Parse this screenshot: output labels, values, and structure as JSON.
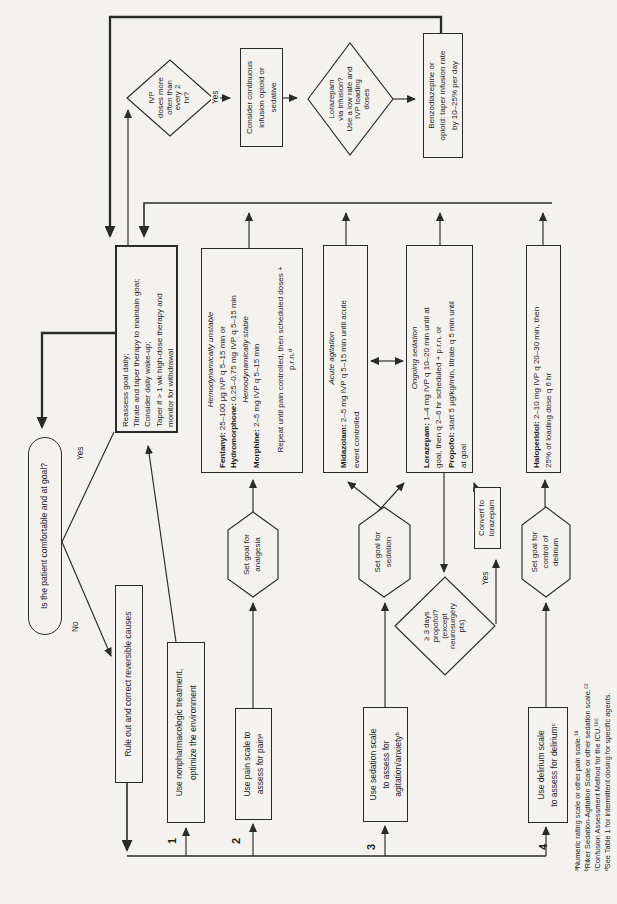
{
  "oval": {
    "text": "Is the patient comfortable and at goal?"
  },
  "labels": {
    "yes_oval": "Yes",
    "no_oval": "No",
    "yes_ivp": "Yes",
    "yes_propofol": "Yes"
  },
  "steps": {
    "n1": "1",
    "n2": "2",
    "n3": "3",
    "n4": "4"
  },
  "boxes": {
    "rule_out": {
      "text": "Rule out and correct reversible causes"
    },
    "nonpharm": {
      "lines": [
        "Use nonpharmacologic treatment,",
        "optimize the environment"
      ]
    },
    "pain": {
      "lines": [
        "Use pain scale to",
        "assess for painᵃ"
      ]
    },
    "sedation_scale": {
      "lines": [
        "Use sedation scale",
        "to assess for",
        "agitation/anxietyᵇ"
      ]
    },
    "delirium_scale": {
      "lines": [
        "Use delirium scale",
        "to assess for deliriumᶜ"
      ]
    },
    "reassess": {
      "lines": [
        "Reassess goal daily;",
        "Titrate and taper therapy to maintain goal;",
        "Consider daily wake-up;",
        "Taper if > 1 wk high-dose therapy and",
        "monitor for withdrawal"
      ]
    },
    "analgesia_drugs": {
      "lines": [
        {
          "i": "Hemodynamically unstable"
        },
        {
          "b": "Fentanyl:",
          "t": " 25–100 μg IVP q 5–15 min or"
        },
        {
          "b": "Hydromorphone:",
          "t": " 0.25–0.75 mg IVP q 5–15 min"
        },
        {
          "i": "Hemodynamically stable"
        },
        {
          "b": "Morphine:",
          "t": " 2–5 mg IVP q 5–15 min"
        },
        {
          "t": ""
        },
        {
          "t": "Repeat until pain controlled, then scheduled doses +"
        },
        {
          "t": "p.r.n.ᵈ"
        }
      ]
    },
    "acute_sedation": {
      "lines": [
        {
          "i": "Acute agitation"
        },
        {
          "b": "Midazolam:",
          "t": " 2–5 mg IVP q 5–15 min until acute"
        },
        {
          "t": "event controlled"
        }
      ]
    },
    "ongoing_sedation": {
      "lines": [
        {
          "i": "Ongoing sedation"
        },
        {
          "b": "Lorazepam:",
          "t": " 1–4 mg IVP q 10–20 min until at"
        },
        {
          "t": "goal, then q 2–6 hr scheduled + p.r.n. or"
        },
        {
          "b": "Propofol:",
          "t": " start 5 μg/kg/min, titrate q 5 min until"
        },
        {
          "t": "at goal"
        }
      ]
    },
    "haloperidol": {
      "lines": [
        {
          "b": "Haloperidol:",
          "t": " 2–10 mg IVP q 20–30 min, then"
        },
        {
          "t": "25% of loading dose q 6 hr"
        }
      ]
    },
    "consider_infusion": {
      "lines": [
        "Consider continuous",
        "infusion opioid or",
        "sedative"
      ]
    },
    "benzo_taper": {
      "lines": [
        "Benzodiazepine or",
        "opioid: taper infusion rate",
        "by 10–25% per day"
      ]
    },
    "convert": {
      "lines": [
        "Convert to",
        "lorazepam"
      ]
    }
  },
  "diamonds": {
    "ivp": {
      "lines": [
        "IVP",
        "doses more",
        "often than",
        "every 2",
        "hr?"
      ]
    },
    "lorazepam_infusion": {
      "lines": [
        "Lorazepam",
        "via infusion?",
        "Use a low rate and",
        "IVP loading",
        "doses"
      ]
    },
    "propofol_3days": {
      "lines": [
        "≥ 3 days",
        "propofol?",
        "(except",
        "neurosurgery",
        "pts)"
      ]
    }
  },
  "hexagons": {
    "analgesia": {
      "lines": [
        "Set goal for",
        "analgesia"
      ]
    },
    "sedation": {
      "lines": [
        "Set goal for",
        "sedation"
      ]
    },
    "delirium": {
      "lines": [
        "Set goal for",
        "control of",
        "delirium"
      ]
    }
  },
  "footnotes": [
    "ᵃNumeric rating scale or other pain scale.¹⁸",
    "ᵇRiker Sedation-Agitation Scale or other sedation scale.⁶²",
    "ᶜConfusion Assessment Method for the ICU.¹⁸⁶",
    "ᵈSee Table 1 for intermittent dosing for specific agents."
  ]
}
